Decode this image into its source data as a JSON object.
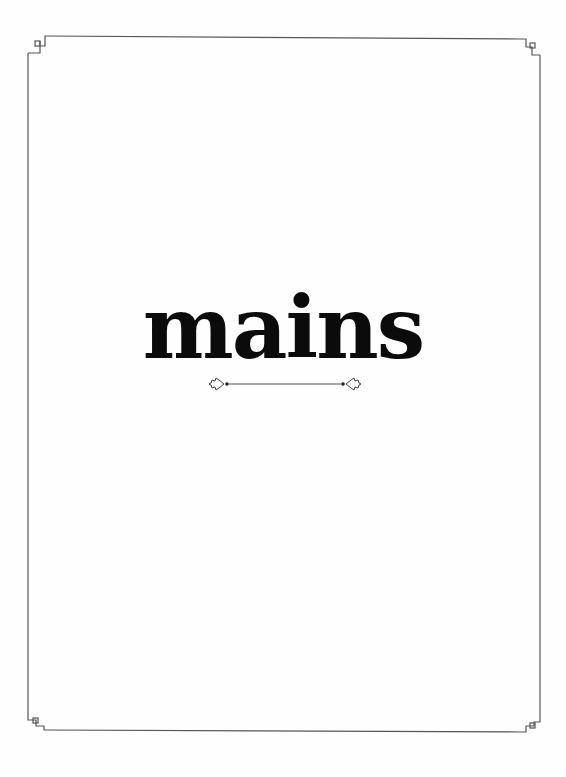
{
  "page": {
    "title": "mains",
    "background_color": "#fefefe",
    "text_color": "#0b0b0b",
    "frame_color": "#555555"
  },
  "ornaments": {
    "frame": "border-frame-with-square-corner-icons",
    "divider": "fleuron-divider-line"
  }
}
